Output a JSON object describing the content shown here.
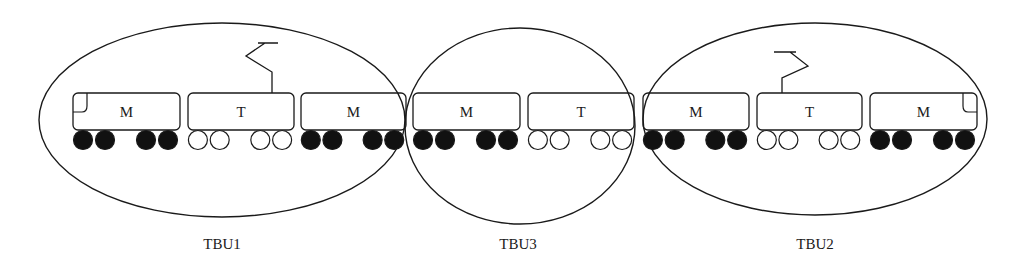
{
  "diagram": {
    "type": "train-traction-unit-grouping",
    "colors": {
      "stroke": "#1a1a1a",
      "background": "#ffffff",
      "powered_wheel": "#111111",
      "trailer_wheel": "#ffffff"
    },
    "cars": [
      {
        "label": "M",
        "type": "motor",
        "x": 73,
        "w": 107,
        "cab": "left"
      },
      {
        "label": "T",
        "type": "trailer",
        "x": 188,
        "w": 106,
        "pantograph": "right"
      },
      {
        "label": "M",
        "type": "motor",
        "x": 301,
        "w": 105
      },
      {
        "label": "M",
        "type": "motor",
        "x": 413,
        "w": 107
      },
      {
        "label": "T",
        "type": "trailer",
        "x": 528,
        "w": 106
      },
      {
        "label": "M",
        "type": "motor",
        "x": 643,
        "w": 106
      },
      {
        "label": "T",
        "type": "trailer",
        "x": 757,
        "w": 105,
        "pantograph": "left"
      },
      {
        "label": "M",
        "type": "motor",
        "x": 870,
        "w": 107,
        "cab": "right"
      }
    ],
    "groups": [
      {
        "label": "TBU1",
        "cx": 222,
        "cy": 120,
        "rx": 183,
        "ry": 97,
        "label_x": 222,
        "label_y": 249
      },
      {
        "label": "TBU3",
        "cx": 520,
        "cy": 126,
        "rx": 115,
        "ry": 98,
        "label_x": 518,
        "label_y": 249
      },
      {
        "label": "TBU2",
        "cx": 815,
        "cy": 119,
        "rx": 172,
        "ry": 96,
        "label_x": 815,
        "label_y": 249
      }
    ]
  }
}
